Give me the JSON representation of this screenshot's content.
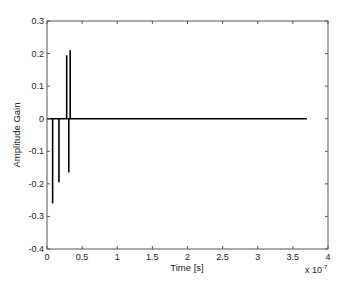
{
  "chart_data": {
    "type": "line",
    "title": "",
    "xlabel": "Time [s]",
    "ylabel": "Amplitude Gain",
    "x_multiplier_label": "x 10",
    "x_multiplier_exponent": "-7",
    "xlim": [
      0,
      4
    ],
    "ylim": [
      -0.4,
      0.3
    ],
    "x_ticks": [
      0,
      0.5,
      1,
      1.5,
      2,
      2.5,
      3,
      3.5,
      4
    ],
    "x_tick_labels": [
      "0",
      "0.5",
      "1",
      "1.5",
      "2",
      "2.5",
      "3",
      "3.5",
      "4"
    ],
    "y_ticks": [
      0.3,
      0.2,
      0.1,
      0,
      -0.1,
      -0.2,
      -0.3,
      -0.4
    ],
    "y_tick_labels": [
      "0.3",
      "0.2",
      "0.1",
      "0",
      "-0.1",
      "-0.2",
      "-0.3",
      "-0.4"
    ],
    "grid": false,
    "legend": null,
    "series": [
      {
        "name": "impulse response",
        "color": "#000000",
        "baseline": {
          "x_start": 0,
          "x_end": 3.7,
          "y": 0
        },
        "spikes": [
          {
            "x": 0.08,
            "y": -0.26
          },
          {
            "x": 0.17,
            "y": -0.195
          },
          {
            "x": 0.28,
            "y": 0.195
          },
          {
            "x": 0.31,
            "y": -0.165
          },
          {
            "x": 0.33,
            "y": 0.21
          }
        ]
      }
    ]
  }
}
